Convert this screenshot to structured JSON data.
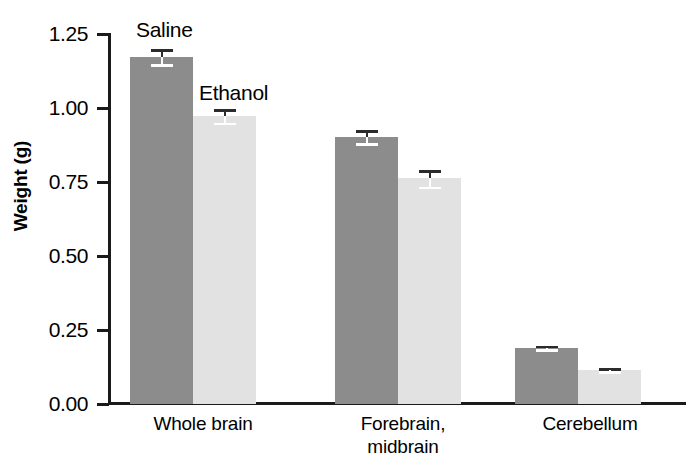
{
  "chart_data": {
    "type": "bar",
    "title": "",
    "subtitle": "",
    "xlabel": "",
    "ylabel": "Weight (g)",
    "ylim": [
      0.0,
      1.25
    ],
    "yticks": [
      "0.00",
      "0.25",
      "0.50",
      "0.75",
      "1.00",
      "1.25"
    ],
    "ytick_values": [
      0.0,
      0.25,
      0.5,
      0.75,
      1.0,
      1.25
    ],
    "grid": false,
    "legend_position": "inline-annotation",
    "categories": [
      "Whole brain",
      "Forebrain,\nmidbrain",
      "Cerebellum"
    ],
    "category_labels_flat": [
      "Whole brain",
      "Forebrain, midbrain",
      "Cerebellum"
    ],
    "series": [
      {
        "name": "Saline",
        "color": "#8c8c8c",
        "values": [
          1.17,
          0.9,
          0.19
        ],
        "errors": [
          0.025,
          0.022,
          0.006
        ]
      },
      {
        "name": "Ethanol",
        "color": "#e2e2e2",
        "values": [
          0.97,
          0.76,
          0.115
        ],
        "errors": [
          0.023,
          0.028,
          0.005
        ]
      }
    ],
    "annotations": [
      {
        "text": "Saline",
        "target_series": "Saline",
        "target_category": "Whole brain"
      },
      {
        "text": "Ethanol",
        "target_series": "Ethanol",
        "target_category": "Whole brain"
      }
    ]
  },
  "axis": {
    "y_label": "Weight (g)",
    "tick_0": "0.00",
    "tick_1": "0.25",
    "tick_2": "0.50",
    "tick_3": "0.75",
    "tick_4": "1.00",
    "tick_5": "1.25"
  },
  "categories": {
    "c0": "Whole brain",
    "c1": "Forebrain,\nmidbrain",
    "c2": "Cerebellum"
  },
  "annotations": {
    "saline": "Saline",
    "ethanol": "Ethanol"
  },
  "colors": {
    "saline_bar": "#8c8c8c",
    "ethanol_bar": "#e2e2e2",
    "axis": "#1a1a1a",
    "error_bar_light": "#ffffff",
    "error_bar_dark": "#2b2b2b",
    "background": "#ffffff"
  }
}
